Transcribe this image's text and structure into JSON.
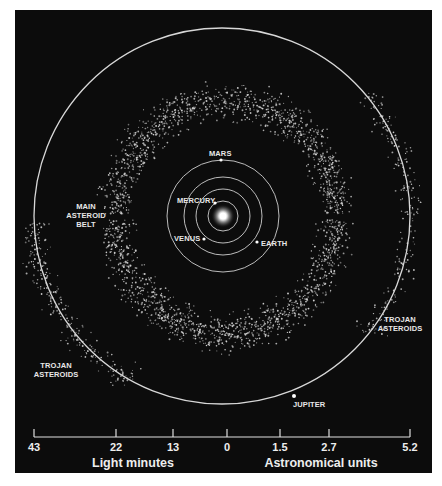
{
  "diagram": {
    "colors": {
      "background": "#0c0c0c",
      "orbit": "#d8d8d8",
      "asteroid": "#cfcfcf",
      "text": "#eeeeee",
      "sun": "#ffffff"
    },
    "sun": {
      "name": "Sun",
      "cx": 223,
      "cy": 216
    },
    "planets": [
      {
        "name": "MERCURY",
        "orbit_radius": 15,
        "dot": [
          215,
          203
        ],
        "label_pos": [
          177,
          203
        ]
      },
      {
        "name": "VENUS",
        "orbit_radius": 27,
        "dot": [
          204,
          239
        ],
        "label_pos": [
          174,
          242
        ]
      },
      {
        "name": "EARTH",
        "orbit_radius": 39,
        "dot": [
          257,
          242
        ],
        "label_pos": [
          260,
          247
        ]
      },
      {
        "name": "MARS",
        "orbit_radius": 56,
        "dot": [
          221,
          165
        ],
        "label_pos": [
          210,
          161
        ]
      },
      {
        "name": "JUPITER",
        "orbit_radius": 188,
        "dot": [
          295,
          396
        ],
        "label_pos": [
          294,
          408
        ]
      }
    ],
    "labels": {
      "main_belt": [
        "MAIN",
        "ASTEROID",
        "BELT"
      ],
      "trojan_right": [
        "TROJAN",
        "ASTEROIDS"
      ],
      "trojan_left": [
        "TROJAN",
        "ASTEROIDS"
      ],
      "jupiter": "JUPITER",
      "mars": "MARS",
      "mercury": "MERCURY",
      "venus": "VENUS",
      "earth": "EARTH"
    },
    "main_belt_region": {
      "cx": 226,
      "cy": 214,
      "rx_inner": 90,
      "ry_inner": 92,
      "rx_outer": 130,
      "ry_outer": 135
    },
    "trojan_groups": [
      {
        "side": "right",
        "arc_start_deg": -40,
        "arc_end_deg": 40
      },
      {
        "side": "left",
        "arc_start_deg": 150,
        "arc_end_deg": 215
      }
    ]
  },
  "scale": {
    "ticks": [
      {
        "label": "43",
        "x": 34
      },
      {
        "label": "22",
        "x": 116
      },
      {
        "label": "13",
        "x": 173
      },
      {
        "label": "0",
        "x": 227
      },
      {
        "label": "1.5",
        "x": 280
      },
      {
        "label": "2.7",
        "x": 329
      },
      {
        "label": "5.2",
        "x": 410
      }
    ],
    "left_unit": "Light minutes",
    "right_unit": "Astronomical units"
  }
}
